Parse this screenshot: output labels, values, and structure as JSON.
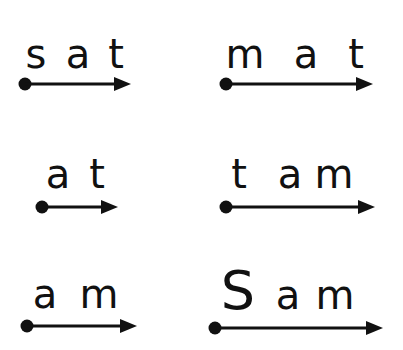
{
  "worksheet": {
    "ink_color": "#111111",
    "background_color": "#ffffff",
    "words": [
      {
        "id": "sat",
        "letters": [
          "s",
          "a",
          "t"
        ]
      },
      {
        "id": "mat",
        "letters": [
          "m",
          "a",
          "t"
        ]
      },
      {
        "id": "at",
        "letters": [
          "a",
          "t"
        ]
      },
      {
        "id": "tam",
        "letters": [
          "t",
          "a",
          "m"
        ]
      },
      {
        "id": "am",
        "letters": [
          "a",
          "m"
        ]
      },
      {
        "id": "Sam",
        "letters": [
          "S",
          "a",
          "m"
        ]
      }
    ]
  }
}
